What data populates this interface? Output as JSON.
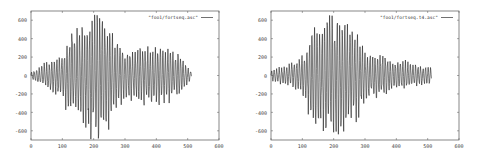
{
  "chart_data": [
    {
      "type": "line",
      "title": "",
      "xlabel": "",
      "ylabel": "",
      "legend": [
        "\"foo1/fortseq.asc\""
      ],
      "legend_position": "top-right",
      "grid": false,
      "xlim": [
        0,
        600
      ],
      "ylim": [
        -700,
        700
      ],
      "x_ticks": [
        "0",
        "100",
        "200",
        "300",
        "400",
        "500",
        "600"
      ],
      "y_ticks": [
        "600",
        "400",
        "200",
        "0",
        "-200",
        "-400",
        "-600"
      ],
      "series": [
        {
          "name": "\"foo1/fortseq.asc\"",
          "x_range": [
            0,
            512
          ],
          "envelope": [
            {
              "x": 0,
              "amp": 40
            },
            {
              "x": 40,
              "amp": 120
            },
            {
              "x": 70,
              "amp": 200
            },
            {
              "x": 100,
              "amp": 220
            },
            {
              "x": 130,
              "amp": 520
            },
            {
              "x": 170,
              "amp": 520
            },
            {
              "x": 200,
              "amp": 700
            },
            {
              "x": 240,
              "amp": 600
            },
            {
              "x": 270,
              "amp": 400
            },
            {
              "x": 300,
              "amp": 280
            },
            {
              "x": 340,
              "amp": 300
            },
            {
              "x": 400,
              "amp": 320
            },
            {
              "x": 440,
              "amp": 300
            },
            {
              "x": 480,
              "amp": 200
            },
            {
              "x": 512,
              "amp": 40
            }
          ],
          "peak_max": 690,
          "peak_min": -690
        }
      ]
    },
    {
      "type": "line",
      "title": "",
      "xlabel": "",
      "ylabel": "",
      "legend": [
        "\"foo1/fortseq.t4.asc\""
      ],
      "legend_position": "top-right",
      "grid": false,
      "xlim": [
        0,
        600
      ],
      "ylim": [
        -700,
        700
      ],
      "x_ticks": [
        "0",
        "100",
        "200",
        "300",
        "400",
        "500",
        "600"
      ],
      "y_ticks": [
        "600",
        "400",
        "200",
        "0",
        "-200",
        "-400",
        "-600"
      ],
      "series": [
        {
          "name": "\"foo1/fortseq.t4.asc\"",
          "x_range": [
            0,
            512
          ],
          "envelope": [
            {
              "x": 0,
              "amp": 60
            },
            {
              "x": 50,
              "amp": 120
            },
            {
              "x": 90,
              "amp": 180
            },
            {
              "x": 110,
              "amp": 250
            },
            {
              "x": 130,
              "amp": 580
            },
            {
              "x": 160,
              "amp": 560
            },
            {
              "x": 200,
              "amp": 700
            },
            {
              "x": 240,
              "amp": 560
            },
            {
              "x": 270,
              "amp": 520
            },
            {
              "x": 300,
              "amp": 280
            },
            {
              "x": 330,
              "amp": 250
            },
            {
              "x": 380,
              "amp": 180
            },
            {
              "x": 450,
              "amp": 130
            },
            {
              "x": 512,
              "amp": 80
            }
          ],
          "peak_max": 690,
          "peak_min": -690
        }
      ]
    }
  ],
  "charts": [
    {
      "legend": "\"foo1/fortseq.asc\"",
      "x_ticks": [
        "0",
        "100",
        "200",
        "300",
        "400",
        "500",
        "600"
      ],
      "y_ticks": [
        "600",
        "400",
        "200",
        "0",
        "-200",
        "-400",
        "-600"
      ]
    },
    {
      "legend": "\"foo1/fortseq.t4.asc\"",
      "x_ticks": [
        "0",
        "100",
        "200",
        "300",
        "400",
        "500",
        "600"
      ],
      "y_ticks": [
        "600",
        "400",
        "200",
        "0",
        "-200",
        "-400",
        "-600"
      ]
    }
  ],
  "style": {
    "line_color": "#111111",
    "axis_color": "#555555",
    "background": "#ffffff"
  }
}
